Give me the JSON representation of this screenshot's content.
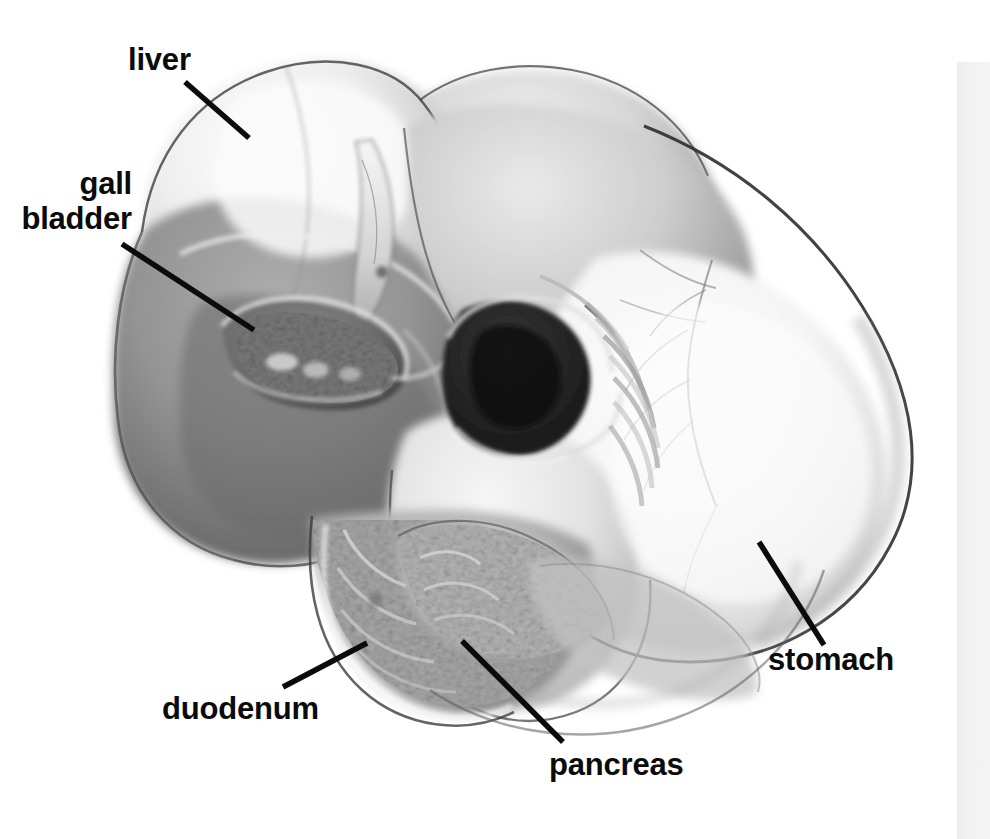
{
  "figure": {
    "kind": "anatomical-illustration",
    "style": "grayscale pencil / airbrush medical drawing",
    "background_color": "#ffffff",
    "ink_color": "#0b0b0b",
    "labels": [
      {
        "id": "liver",
        "text": "liver",
        "lines": [
          "liver"
        ],
        "x": 128,
        "y": 42,
        "align": "left",
        "leader": {
          "x1": 185,
          "y1": 82,
          "x2": 249,
          "y2": 138
        }
      },
      {
        "id": "gall-bladder",
        "text": "gall bladder",
        "lines": [
          "gall",
          "bladder"
        ],
        "x": 0,
        "y": 166,
        "align": "right",
        "leader": {
          "x1": 122,
          "y1": 244,
          "x2": 254,
          "y2": 330
        }
      },
      {
        "id": "duodenum",
        "text": "duodenum",
        "lines": [
          "duodenum"
        ],
        "x": 162,
        "y": 691,
        "align": "left",
        "leader": {
          "x1": 283,
          "y1": 687,
          "x2": 367,
          "y2": 643
        }
      },
      {
        "id": "pancreas",
        "text": "pancreas",
        "lines": [
          "pancreas"
        ],
        "x": 549,
        "y": 747,
        "align": "left",
        "leader": {
          "x1": 462,
          "y1": 641,
          "x2": 563,
          "y2": 742
        }
      },
      {
        "id": "stomach",
        "text": "stomach",
        "lines": [
          "stomach"
        ],
        "x": 768,
        "y": 642,
        "align": "left",
        "leader": {
          "x1": 759,
          "y1": 542,
          "x2": 824,
          "y2": 645
        }
      }
    ],
    "organs": [
      {
        "name": "liver",
        "tone": "light upper lobe, mid-gray lower lobe"
      },
      {
        "name": "gall bladder",
        "tone": "dark recessed pocket under liver"
      },
      {
        "name": "stomach",
        "tone": "pale body with dark outline and vessels"
      },
      {
        "name": "duodenum",
        "tone": "mid-gray textured loop"
      },
      {
        "name": "pancreas",
        "tone": "mottled gray lobulated tissue"
      }
    ],
    "scan_edge_band": {
      "present": true,
      "x": 957,
      "y": 62,
      "width": 33,
      "height": 777,
      "color": "#f1f1f1"
    }
  }
}
